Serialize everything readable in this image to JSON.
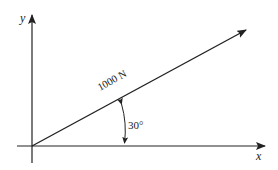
{
  "diagram": {
    "type": "force-vector",
    "axes": {
      "x_label": "x",
      "y_label": "y"
    },
    "force": {
      "magnitude_label": "1000 N",
      "angle_label": "30°",
      "angle_degrees": 30
    },
    "colors": {
      "line": "#222222",
      "background": "#ffffff"
    }
  }
}
